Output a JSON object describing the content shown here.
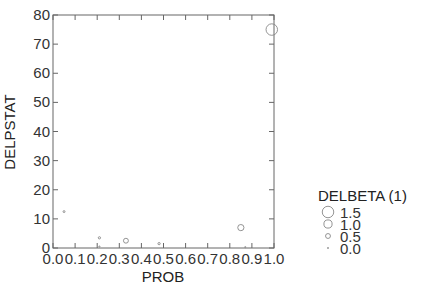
{
  "chart_data": {
    "type": "scatter",
    "title": "",
    "xlabel": "PROB",
    "ylabel": "DELPSTAT",
    "xlim": [
      0,
      1
    ],
    "ylim": [
      0,
      80
    ],
    "xticks": [
      "0.0",
      "0.1",
      "0.2",
      "0.3",
      "0.4",
      "0.5",
      "0.6",
      "0.7",
      "0.8",
      "0.9",
      "1.0"
    ],
    "yticks": [
      "0",
      "10",
      "20",
      "30",
      "40",
      "50",
      "60",
      "70",
      "80"
    ],
    "grid": false,
    "size_variable": "DELBETA (1)",
    "points": [
      {
        "x": 0.05,
        "y": 12.5,
        "size": 0.05
      },
      {
        "x": 0.21,
        "y": 3.5,
        "size": 0.1
      },
      {
        "x": 0.21,
        "y": 0.5,
        "size": 0.0
      },
      {
        "x": 0.33,
        "y": 2.5,
        "size": 0.5
      },
      {
        "x": 0.48,
        "y": 1.5,
        "size": 0.1
      },
      {
        "x": 0.85,
        "y": 7.0,
        "size": 0.7
      },
      {
        "x": 0.87,
        "y": 0.3,
        "size": 0.0
      },
      {
        "x": 0.99,
        "y": 75.0,
        "size": 1.5
      }
    ],
    "legend": {
      "title": "DELBETA (1)",
      "position": "right",
      "entries": [
        {
          "label": "1.5",
          "size": 1.5
        },
        {
          "label": "1.0",
          "size": 1.0
        },
        {
          "label": "0.5",
          "size": 0.5
        },
        {
          "label": "0.0",
          "size": 0.0
        }
      ]
    },
    "colors": {
      "marker": "#888888",
      "axis": "#666666"
    }
  },
  "axes": {
    "x_title": "PROB",
    "y_title": "DELPSTAT"
  },
  "legend": {
    "title": "DELBETA (1)",
    "labels": [
      "1.5",
      "1.0",
      "0.5",
      "0.0"
    ]
  }
}
